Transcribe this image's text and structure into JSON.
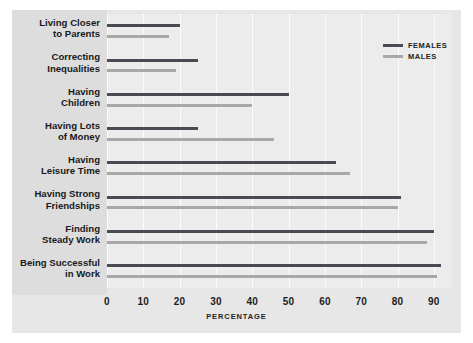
{
  "chart_data": {
    "type": "bar",
    "orientation": "horizontal",
    "title": "",
    "xlabel": "PERCENTAGE",
    "ylabel": "",
    "xlim": [
      0,
      95
    ],
    "xticks": [
      0,
      10,
      20,
      30,
      40,
      50,
      60,
      70,
      80,
      90
    ],
    "xtick_labels": [
      "0",
      "10",
      "20",
      "30",
      "40",
      "50",
      "60",
      "70",
      "80",
      "90"
    ],
    "grid": true,
    "legend_position": "top-right",
    "categories": [
      "Living Closer\nto Parents",
      "Correcting\nInequalities",
      "Having\nChildren",
      "Having Lots\nof Money",
      "Having\nLeisure Time",
      "Having Strong\nFriendships",
      "Finding\nSteady Work",
      "Being Successful\nin Work"
    ],
    "category_lines": [
      [
        "Living Closer",
        "to Parents"
      ],
      [
        "Correcting",
        "Inequalities"
      ],
      [
        "Having",
        "Children"
      ],
      [
        "Having Lots",
        "of Money"
      ],
      [
        "Having",
        "Leisure Time"
      ],
      [
        "Having Strong",
        "Friendships"
      ],
      [
        "Finding",
        "Steady Work"
      ],
      [
        "Being Successful",
        "in Work"
      ]
    ],
    "series": [
      {
        "name": "FEMALES",
        "color": "#4a4a52",
        "values": [
          20,
          25,
          50,
          25,
          63,
          81,
          90,
          92
        ]
      },
      {
        "name": "MALES",
        "color": "#a8a8a8",
        "values": [
          17,
          19,
          40,
          46,
          67,
          80,
          88,
          91
        ]
      }
    ]
  },
  "legend": {
    "items": [
      {
        "label": "FEMALES",
        "color": "#4a4a52"
      },
      {
        "label": "MALES",
        "color": "#a8a8a8"
      }
    ]
  },
  "axis": {
    "x_title": "PERCENTAGE"
  },
  "colors": {
    "females": "#4a4a52",
    "males": "#a8a8a8",
    "panel_background": "#e7e7e7",
    "plot_background": "#ececec",
    "label_gutter": "#dddddd",
    "gridline": "#fbfbfb",
    "text": "#1a1a1a"
  }
}
